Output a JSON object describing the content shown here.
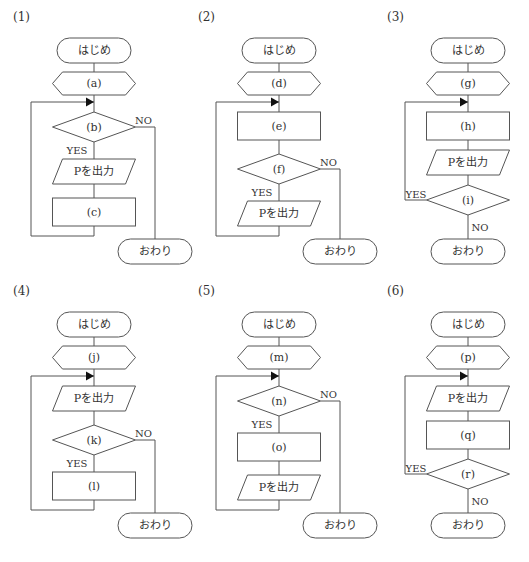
{
  "figure": {
    "start_label": "はじめ",
    "end_label": "おわり",
    "output_label": "Pを出力",
    "yes_label": "YES",
    "no_label": "NO",
    "charts": [
      {
        "id": "(1)",
        "type": "pre-test-loop",
        "steps": [
          {
            "kind": "init",
            "label": "(a)"
          },
          {
            "kind": "decision",
            "label": "(b)"
          },
          {
            "kind": "output"
          },
          {
            "kind": "process",
            "label": "(c)"
          }
        ]
      },
      {
        "id": "(2)",
        "type": "mid-test-loop",
        "steps": [
          {
            "kind": "init",
            "label": "(d)"
          },
          {
            "kind": "process",
            "label": "(e)"
          },
          {
            "kind": "decision",
            "label": "(f)"
          },
          {
            "kind": "output"
          }
        ]
      },
      {
        "id": "(3)",
        "type": "post-test-loop",
        "steps": [
          {
            "kind": "init",
            "label": "(g)"
          },
          {
            "kind": "process",
            "label": "(h)"
          },
          {
            "kind": "output"
          },
          {
            "kind": "decision",
            "label": "(i)"
          }
        ]
      },
      {
        "id": "(4)",
        "type": "mid-test-loop",
        "steps": [
          {
            "kind": "init",
            "label": "(j)"
          },
          {
            "kind": "output"
          },
          {
            "kind": "decision",
            "label": "(k)"
          },
          {
            "kind": "process",
            "label": "(l)"
          }
        ]
      },
      {
        "id": "(5)",
        "type": "pre-test-loop",
        "steps": [
          {
            "kind": "init",
            "label": "(m)"
          },
          {
            "kind": "decision",
            "label": "(n)"
          },
          {
            "kind": "process",
            "label": "(o)"
          },
          {
            "kind": "output"
          }
        ]
      },
      {
        "id": "(6)",
        "type": "post-test-loop",
        "steps": [
          {
            "kind": "init",
            "label": "(p)"
          },
          {
            "kind": "output"
          },
          {
            "kind": "process",
            "label": "(q)"
          },
          {
            "kind": "decision",
            "label": "(r)"
          }
        ]
      }
    ]
  }
}
